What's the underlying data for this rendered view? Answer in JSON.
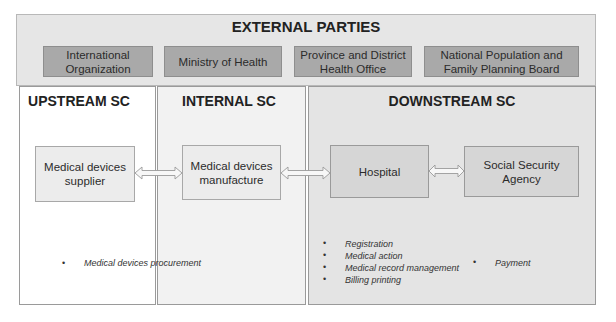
{
  "external": {
    "title": "EXTERNAL PARTIES",
    "parties": [
      {
        "line1": "International",
        "line2": "Organization"
      },
      {
        "line1": "Ministry of Health",
        "line2": ""
      },
      {
        "line1": "Province and District",
        "line2": "Health Office"
      },
      {
        "line1": "National Population and",
        "line2": "Family Planning Board"
      }
    ]
  },
  "upstream": {
    "title": "UPSTREAM SC",
    "node": {
      "line1": "Medical devices",
      "line2": "supplier"
    },
    "activities": [
      "Medical devices procurement"
    ]
  },
  "internal": {
    "title": "INTERNAL SC",
    "node": {
      "line1": "Medical devices",
      "line2": "manufacture"
    }
  },
  "downstream": {
    "title": "DOWNSTREAM SC",
    "nodes": [
      {
        "line1": "Hospital",
        "line2": ""
      },
      {
        "line1": "Social Security",
        "line2": "Agency"
      }
    ],
    "hospital_activities": [
      "Registration",
      "Medical action",
      "Medical record management",
      "Billing printing"
    ],
    "agency_activities": [
      "Payment"
    ]
  },
  "connections": [
    {
      "from": "Medical devices supplier",
      "to": "Medical devices manufacture",
      "type": "bidirectional"
    },
    {
      "from": "Medical devices manufacture",
      "to": "Hospital",
      "type": "bidirectional"
    },
    {
      "from": "Hospital",
      "to": "Social Security Agency",
      "type": "bidirectional"
    }
  ],
  "bullet": "•"
}
